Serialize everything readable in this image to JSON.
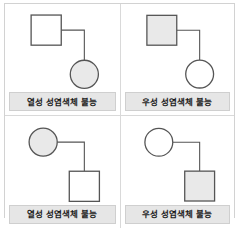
{
  "figure": {
    "type": "pedigree-chart-grid",
    "rows": 2,
    "columns": 2,
    "colors": {
      "stroke": "#555555",
      "shaded_fill": "#e9e9e9",
      "unshaded_fill": "#ffffff",
      "caption_bg": "#e6e6e6",
      "caption_border": "#cfcfcf",
      "frame_border": "#d2d2d2",
      "caption_text": "#1a1a1a"
    },
    "panels": [
      {
        "id": "panel-top-left",
        "position": "top-left",
        "caption": "열성 성염색체 불능",
        "parent": {
          "symbol": "square",
          "sex": "male",
          "shaded": false
        },
        "child": {
          "symbol": "circle",
          "sex": "female",
          "shaded": true
        }
      },
      {
        "id": "panel-top-right",
        "position": "top-right",
        "caption": "우성 성염색체 불능",
        "parent": {
          "symbol": "square",
          "sex": "male",
          "shaded": true
        },
        "child": {
          "symbol": "circle",
          "sex": "female",
          "shaded": false
        }
      },
      {
        "id": "panel-bottom-left",
        "position": "bottom-left",
        "caption": "열성 성염색체 불능",
        "parent": {
          "symbol": "circle",
          "sex": "female",
          "shaded": true
        },
        "child": {
          "symbol": "square",
          "sex": "male",
          "shaded": false
        }
      },
      {
        "id": "panel-bottom-right",
        "position": "bottom-right",
        "caption": "우성 성염색체 불능",
        "parent": {
          "symbol": "circle",
          "sex": "female",
          "shaded": false
        },
        "child": {
          "symbol": "square",
          "sex": "male",
          "shaded": true
        }
      }
    ]
  }
}
